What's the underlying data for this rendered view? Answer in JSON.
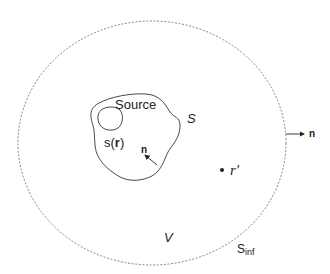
{
  "diagram": {
    "labels": {
      "source": "Source",
      "source_density_prefix": "s(",
      "source_density_var": "r",
      "source_density_suffix": ")",
      "surface": "S",
      "inner_normal": "n",
      "outer_normal": "n",
      "field_point": "r'",
      "volume": "V",
      "outer_surface_main": "S",
      "outer_surface_sub": "inf"
    },
    "colors": {
      "stroke": "#333333",
      "dashed_stroke": "#777777",
      "text": "#222222"
    }
  }
}
